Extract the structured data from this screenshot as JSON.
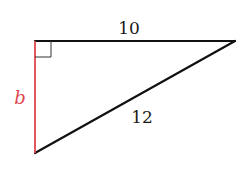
{
  "diagram": {
    "type": "right-triangle",
    "colors": {
      "edge": "#111111",
      "highlight": "#e0454f",
      "right_angle_marker": "#333333",
      "background": "#ffffff"
    },
    "vertices": {
      "right_angle": {
        "x": 35,
        "y": 41
      },
      "top_right": {
        "x": 235,
        "y": 41
      },
      "bottom": {
        "x": 35,
        "y": 153
      }
    },
    "sides": [
      {
        "name": "top-leg",
        "label": "10"
      },
      {
        "name": "hypotenuse",
        "label": "12"
      },
      {
        "name": "left-leg",
        "label": "b",
        "highlighted": true
      }
    ],
    "right_angle_marker": true
  }
}
